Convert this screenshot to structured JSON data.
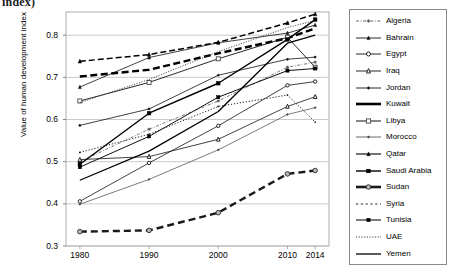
{
  "title_fragment": "index)",
  "axis": {
    "y_title": "Value of human development index",
    "y_ticks": [
      "0.8",
      "0.7",
      "0.6",
      "0.5",
      "0.4",
      "0.3"
    ],
    "x_ticks": [
      "1980",
      "1990",
      "2000",
      "2010",
      "2014"
    ]
  },
  "legend": {
    "entries": [
      {
        "label": "Algeria",
        "marker": "plus-marker",
        "line": "dash-dot-thin"
      },
      {
        "label": "Bahrain",
        "marker": "triangle-up-filled",
        "line": "solid-thin"
      },
      {
        "label": "Egypt",
        "marker": "circle-open",
        "line": "solid-thin"
      },
      {
        "label": "Iraq",
        "marker": "triangle-up-open",
        "line": "solid-thin"
      },
      {
        "label": "Jordan",
        "marker": "diamond-small-filled",
        "line": "solid-thin"
      },
      {
        "label": "Kuwait",
        "marker": "dot-small",
        "line": "solid-thick"
      },
      {
        "label": "Libya",
        "marker": "square-open",
        "line": "solid-thin"
      },
      {
        "label": "Morocco",
        "marker": "diamond-small-filled",
        "line": "solid-thin"
      },
      {
        "label": "Qatar",
        "marker": "triangle-up-filled",
        "line": "solid-thin"
      },
      {
        "label": "Saudi Arabia",
        "marker": "square-filled",
        "line": "solid-thin"
      },
      {
        "label": "Sudan",
        "marker": "circle-gray-filled",
        "line": "solid-thick"
      },
      {
        "label": "Syria",
        "marker": "dot-small",
        "line": "dotted-dash"
      },
      {
        "label": "Tunisia",
        "marker": "square-filled",
        "line": "solid-thin"
      },
      {
        "label": "UAE",
        "marker": "none",
        "line": "dotted-fine"
      },
      {
        "label": "Yemen",
        "marker": "none",
        "line": "solid-medium"
      }
    ]
  },
  "chart_data": {
    "type": "line",
    "title": "index)",
    "xlabel": "",
    "ylabel": "Value of human development index",
    "x": [
      1980,
      1990,
      2000,
      2010,
      2014
    ],
    "ylim": [
      0.3,
      0.855
    ],
    "xlim": [
      1978,
      2016
    ],
    "grid": true,
    "legend_position": "right",
    "series": [
      {
        "name": "Algeria",
        "values": [
          0.5,
          0.577,
          0.644,
          0.724,
          0.736
        ]
      },
      {
        "name": "Bahrain",
        "values": [
          0.677,
          0.747,
          0.782,
          0.805,
          0.824
        ]
      },
      {
        "name": "Egypt",
        "values": [
          0.406,
          0.497,
          0.585,
          0.681,
          0.69
        ]
      },
      {
        "name": "Iraq",
        "values": [
          0.505,
          0.512,
          0.553,
          0.631,
          0.654
        ]
      },
      {
        "name": "Jordan",
        "values": [
          0.586,
          0.625,
          0.705,
          0.743,
          0.748
        ]
      },
      {
        "name": "Kuwait",
        "values": [
          0.702,
          0.718,
          0.757,
          0.793,
          0.816
        ]
      },
      {
        "name": "Libya",
        "values": [
          0.644,
          0.688,
          0.744,
          0.795,
          0.724
        ]
      },
      {
        "name": "Morocco",
        "values": [
          0.399,
          0.458,
          0.528,
          0.612,
          0.628
        ]
      },
      {
        "name": "Qatar",
        "values": [
          0.738,
          0.754,
          0.783,
          0.829,
          0.85
        ]
      },
      {
        "name": "Saudi Arabia",
        "values": [
          0.494,
          0.615,
          0.686,
          0.79,
          0.837
        ]
      },
      {
        "name": "Sudan",
        "values": [
          0.334,
          0.337,
          0.379,
          0.471,
          0.479
        ]
      },
      {
        "name": "Syria",
        "values": [
          0.522,
          0.565,
          0.631,
          0.658,
          0.594
        ]
      },
      {
        "name": "Tunisia",
        "values": [
          0.487,
          0.56,
          0.653,
          0.716,
          0.721
        ]
      },
      {
        "name": "UAE",
        "values": [
          0.64,
          0.695,
          0.761,
          0.818,
          0.835
        ]
      },
      {
        "name": "Yemen",
        "values": [
          0.456,
          0.525,
          0.619,
          0.781,
          0.8
        ]
      }
    ]
  }
}
